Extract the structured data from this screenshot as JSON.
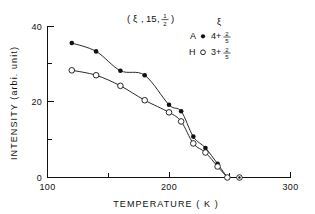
{
  "chart_data": {
    "type": "scatter",
    "title_parts": {
      "open_paren": "(",
      "xi": "ξ",
      "comma1": ",",
      "fifteen": "15",
      "comma2": ",",
      "frac_num": "1",
      "frac_den": "2",
      "close_paren": ")"
    },
    "xlabel": "TEMPERATURE ( K )",
    "ylabel": "INTENSITY (arbi. unit)",
    "xlim": [
      100,
      300
    ],
    "ylim": [
      0,
      40
    ],
    "xticks_major": [
      100,
      200,
      300
    ],
    "xticks_minor": [
      150,
      250
    ],
    "yticks_major": [
      0,
      20,
      40
    ],
    "yticks_minor": [
      10,
      30
    ],
    "xtick_labels": [
      "100",
      "200",
      "300"
    ],
    "ytick_labels": [
      "0",
      "20",
      "40"
    ],
    "grid": false,
    "legend_position": "top-right",
    "legend_header": "ξ",
    "series": [
      {
        "name": "A",
        "marker": "filled-circle",
        "label_prefix": "A",
        "label_int": "4+",
        "label_frac_num": "2",
        "label_frac_den": "5",
        "x": [
          120,
          140,
          160,
          180,
          200,
          210,
          220,
          230,
          240,
          248
        ],
        "y": [
          35.5,
          33.3,
          28.2,
          27.0,
          19.2,
          17.5,
          10.8,
          7.8,
          3.6,
          0.0
        ]
      },
      {
        "name": "H",
        "marker": "open-circle",
        "label_prefix": "H",
        "label_int": "3+",
        "label_frac_num": "2",
        "label_frac_den": "5",
        "x": [
          120,
          140,
          160,
          180,
          200,
          210,
          220,
          230,
          240,
          248
        ],
        "y": [
          28.3,
          27.0,
          24.2,
          20.4,
          17.2,
          14.8,
          9.0,
          6.6,
          2.9,
          0.0
        ]
      }
    ],
    "extra_zero_points": [
      {
        "x": 258,
        "y": 0.0,
        "marker": "open-circle-dot"
      }
    ]
  }
}
